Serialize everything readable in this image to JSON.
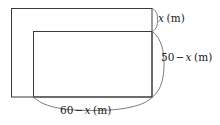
{
  "figure": {
    "kind": "geometry-diagram",
    "stroke_color": "#3a3a3a",
    "brace_color": "#6e6e6e",
    "background_color": "#ffffff",
    "outer_rect": {
      "x": 11,
      "y": 8,
      "width": 141,
      "height": 89
    },
    "inner_rect": {
      "x": 33,
      "y": 31,
      "width": 119,
      "height": 66
    }
  },
  "labels": {
    "height_top": {
      "name": "x-height-label",
      "variable": "x",
      "unit": "(m)",
      "full_text": "x (m)"
    },
    "height_right": {
      "name": "fifty-minus-x-label",
      "number": "50",
      "operator": "−",
      "variable": "x",
      "unit": "(m)",
      "full_text": "50 − x (m)"
    },
    "width_bottom": {
      "name": "sixty-minus-x-label",
      "number": "60",
      "operator": "−",
      "variable": "x",
      "unit": "(m)",
      "full_text": "60 − x (m)"
    }
  },
  "braces": {
    "top_right": {
      "name": "brace-x",
      "orientation": "vertical",
      "from": 8,
      "to": 31
    },
    "right": {
      "name": "brace-50-minus-x",
      "orientation": "vertical",
      "from": 31,
      "to": 97
    },
    "bottom": {
      "name": "brace-60-minus-x",
      "orientation": "horizontal",
      "from": 33,
      "to": 152
    }
  }
}
